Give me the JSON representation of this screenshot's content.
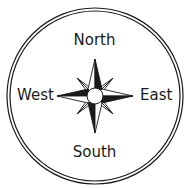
{
  "diagram": {
    "type": "compass-rose",
    "labels": {
      "north": "North",
      "south": "South",
      "east": "East",
      "west": "West"
    },
    "colors": {
      "ink": "#1a1a1a",
      "background": "#ffffff"
    },
    "icons": {
      "rose": "compass-rose-icon",
      "ring": "double-circle-border"
    }
  }
}
